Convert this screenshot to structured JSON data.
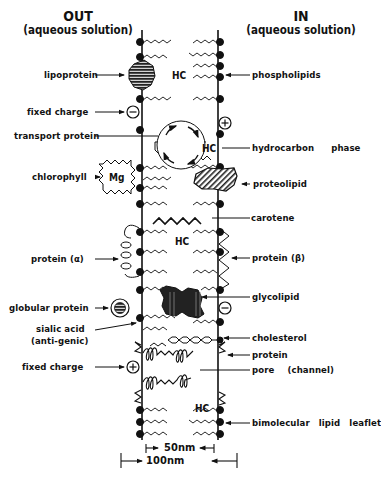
{
  "header": {
    "out_title": "OUT",
    "out_subtitle": "(aqueous solution)",
    "in_title": "IN",
    "in_subtitle": "(aqueous solution)"
  },
  "left_labels": [
    {
      "id": "lipoprotein",
      "text": "lipoprotein"
    },
    {
      "id": "fixed-charge-top",
      "text": "fixed charge"
    },
    {
      "id": "transport-protein",
      "text": "transport protein"
    },
    {
      "id": "chlorophyll",
      "text": "chlorophyll"
    },
    {
      "id": "protein-alpha",
      "text": "protein (α)"
    },
    {
      "id": "globular-protein",
      "text": "globular protein"
    },
    {
      "id": "sialic-acid",
      "text": "sialic acid"
    },
    {
      "id": "sialic-acid-sub",
      "text": "(anti-genic)"
    },
    {
      "id": "fixed-charge-bottom",
      "text": "fixed charge"
    }
  ],
  "right_labels": [
    {
      "id": "phospholipids",
      "text": "phospholipids"
    },
    {
      "id": "hydrocarbon-phase",
      "text": "hydrocarbon phase"
    },
    {
      "id": "proteolipid",
      "text": "proteolipid"
    },
    {
      "id": "carotene",
      "text": "carotene"
    },
    {
      "id": "protein-beta",
      "text": "protein (β)"
    },
    {
      "id": "glycolipid",
      "text": "glycolipid"
    },
    {
      "id": "cholesterol",
      "text": "cholesterol"
    },
    {
      "id": "protein",
      "text": "protein"
    },
    {
      "id": "pore",
      "text": "pore (channel)"
    },
    {
      "id": "bimolecular-lipid-leaflet",
      "text": "bimolecular lipid leaflet"
    }
  ],
  "inner": {
    "hc": "HC",
    "mg": "Mg",
    "minus": "−",
    "plus": "+"
  },
  "scale": {
    "inner": "50nm",
    "outer": "100nm"
  }
}
